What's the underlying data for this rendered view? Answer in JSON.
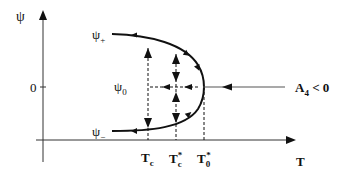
{
  "diagram": {
    "type": "bifurcation-diagram",
    "y_axis": {
      "label": "ψ",
      "tick_zero": "0"
    },
    "x_axis": {
      "label": "T"
    },
    "branches": {
      "upper": "ψ₊",
      "lower": "ψ₋",
      "middle": "ψ₀"
    },
    "upper_label": {
      "main": "ψ",
      "sub": "+"
    },
    "lower_label": {
      "main": "ψ",
      "sub": "−"
    },
    "middle_label": {
      "main": "ψ",
      "sub": "0"
    },
    "x_ticks": [
      {
        "main": "T",
        "sub": "c",
        "sup": ""
      },
      {
        "main": "T",
        "sub": "c",
        "sup": "*"
      },
      {
        "main": "T",
        "sub": "0",
        "sup": "*"
      }
    ],
    "condition": {
      "main": "A",
      "sub": "4",
      "rest": " < 0"
    },
    "colors": {
      "line": "#111111",
      "background": "#ffffff"
    }
  }
}
